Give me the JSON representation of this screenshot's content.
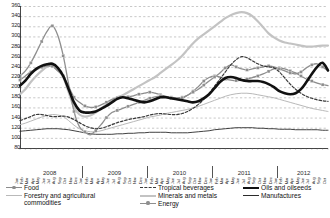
{
  "chart_data": {
    "type": "line",
    "title": "",
    "subtitle": "",
    "xlabel": "",
    "ylabel": "",
    "ylim": [
      80,
      360
    ],
    "ytick_step": 20,
    "yticks": [
      360,
      340,
      320,
      300,
      280,
      260,
      240,
      220,
      200,
      180,
      160,
      140,
      120,
      100,
      80
    ],
    "grid": "horizontal-dashed",
    "legend_position": "bottom",
    "x_unit": "month",
    "years": [
      "2008",
      "2009",
      "2010",
      "2011",
      "2012"
    ],
    "months": [
      "Jan",
      "Feb",
      "Mar",
      "Apr",
      "May",
      "Jun",
      "Jul",
      "Aug",
      "Sep",
      "Oct",
      "Nov",
      "Dec"
    ],
    "x_start": "2008-01",
    "x_end": "2012-10",
    "n_points": 58,
    "series": [
      {
        "name": "Food",
        "key": "food",
        "color": "#8c8c8c",
        "style": "line-markers",
        "marker": "square",
        "width": 1.3,
        "values": [
          214,
          222,
          230,
          234,
          239,
          242,
          241,
          232,
          222,
          201,
          180,
          170,
          163,
          160,
          161,
          165,
          170,
          176,
          179,
          180,
          181,
          183,
          186,
          188,
          190,
          188,
          185,
          182,
          180,
          179,
          180,
          184,
          192,
          201,
          212,
          219,
          222,
          220,
          216,
          214,
          213,
          214,
          216,
          219,
          222,
          226,
          231,
          236,
          238,
          236,
          232,
          228,
          222,
          216,
          212,
          208,
          205,
          203
        ]
      },
      {
        "name": "Forestry and agricultural commodities",
        "key": "forestry",
        "color": "#b9b9b9",
        "style": "line",
        "marker": "none",
        "width": 1.0,
        "values": [
          126,
          129,
          133,
          137,
          141,
          144,
          146,
          145,
          142,
          134,
          125,
          118,
          114,
          112,
          112,
          114,
          117,
          120,
          123,
          126,
          129,
          132,
          135,
          138,
          141,
          143,
          145,
          148,
          150,
          152,
          154,
          156,
          159,
          162,
          166,
          170,
          174,
          178,
          182,
          185,
          187,
          188,
          188,
          187,
          185,
          183,
          181,
          179,
          176,
          173,
          170,
          167,
          164,
          161,
          158,
          156,
          154,
          152
        ]
      },
      {
        "name": "Tropical beverages",
        "key": "tropical_beverages",
        "color": "#3a3a3a",
        "style": "dashed",
        "marker": "none",
        "width": 1.2,
        "values": [
          134,
          138,
          142,
          146,
          146,
          144,
          142,
          142,
          143,
          141,
          136,
          130,
          124,
          120,
          118,
          119,
          122,
          126,
          130,
          133,
          136,
          138,
          140,
          142,
          145,
          147,
          148,
          147,
          146,
          146,
          148,
          152,
          158,
          166,
          176,
          188,
          202,
          216,
          230,
          244,
          254,
          260,
          258,
          252,
          246,
          242,
          240,
          238,
          230,
          218,
          206,
          196,
          188,
          182,
          178,
          175,
          173,
          172
        ]
      },
      {
        "name": "Minerals and metals",
        "key": "minerals_metals",
        "color": "#c3c3c3",
        "style": "line",
        "marker": "none",
        "width": 2.2,
        "values": [
          186,
          196,
          210,
          222,
          232,
          240,
          242,
          234,
          220,
          190,
          160,
          146,
          142,
          144,
          150,
          158,
          166,
          174,
          180,
          184,
          190,
          196,
          202,
          208,
          214,
          220,
          228,
          236,
          244,
          252,
          262,
          274,
          286,
          296,
          304,
          312,
          320,
          328,
          336,
          342,
          346,
          348,
          346,
          340,
          330,
          318,
          306,
          298,
          292,
          288,
          286,
          284,
          282,
          280,
          280,
          281,
          282,
          282
        ]
      },
      {
        "name": "Energy",
        "key": "energy",
        "color": "#8f8f8f",
        "style": "line-markers",
        "marker": "square",
        "width": 1.3,
        "values": [
          222,
          232,
          248,
          268,
          290,
          310,
          321,
          302,
          262,
          206,
          152,
          122,
          112,
          106,
          114,
          126,
          140,
          150,
          154,
          158,
          162,
          166,
          170,
          174,
          178,
          181,
          182,
          180,
          178,
          176,
          178,
          184,
          190,
          196,
          204,
          212,
          220,
          228,
          238,
          244,
          240,
          236,
          234,
          236,
          238,
          240,
          242,
          240,
          236,
          232,
          228,
          226,
          230,
          238,
          244,
          246,
          240,
          232
        ]
      },
      {
        "name": "Oils and oilseeds",
        "key": "oils_oilseeds",
        "color": "#111111",
        "style": "line",
        "marker": "none",
        "width": 2.6,
        "values": [
          203,
          213,
          226,
          236,
          242,
          245,
          246,
          238,
          222,
          196,
          170,
          154,
          150,
          150,
          152,
          157,
          163,
          170,
          177,
          180,
          178,
          175,
          172,
          170,
          172,
          176,
          180,
          180,
          178,
          176,
          174,
          172,
          170,
          172,
          178,
          186,
          198,
          210,
          218,
          220,
          218,
          214,
          212,
          212,
          212,
          210,
          206,
          200,
          192,
          188,
          186,
          188,
          196,
          210,
          226,
          240,
          248,
          233
        ]
      },
      {
        "name": "Manufactures",
        "key": "manufactures",
        "color": "#2b2b2b",
        "style": "line",
        "marker": "none",
        "width": 0.9,
        "values": [
          113,
          114,
          115,
          116,
          117,
          118,
          118,
          118,
          117,
          116,
          114,
          112,
          110,
          108,
          107,
          107,
          107,
          107,
          108,
          108,
          109,
          109,
          110,
          110,
          111,
          111,
          111,
          111,
          110,
          110,
          110,
          110,
          111,
          112,
          113,
          114,
          116,
          117,
          118,
          119,
          120,
          120,
          120,
          120,
          119,
          119,
          118,
          118,
          117,
          117,
          117,
          116,
          116,
          116,
          116,
          116,
          115,
          115
        ]
      }
    ]
  },
  "legend": {
    "columns": [
      {
        "items": [
          {
            "label": "Food",
            "key": "food"
          },
          {
            "label": "Forestry and agricultural\ncommodities",
            "key": "forestry"
          }
        ]
      },
      {
        "items": [
          {
            "label": "Tropical beverages",
            "key": "tropical_beverages"
          },
          {
            "label": "Minerals and metals",
            "key": "minerals_metals"
          },
          {
            "label": "Energy",
            "key": "energy"
          }
        ]
      },
      {
        "items": [
          {
            "label": "Oils and oilseeds",
            "key": "oils_oilseeds"
          },
          {
            "label": "Manufactures",
            "key": "manufactures"
          }
        ]
      }
    ]
  }
}
